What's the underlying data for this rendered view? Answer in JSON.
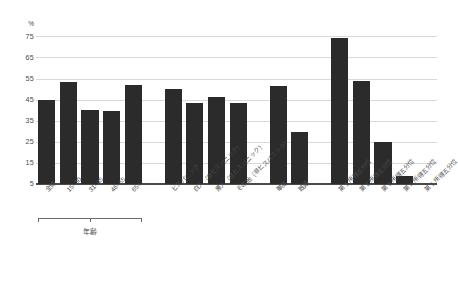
{
  "chart_data": {
    "type": "bar",
    "title": "",
    "subtitle": "",
    "xlabel": "",
    "ylabel": "%",
    "ylim": [
      5,
      78
    ],
    "yticks": [
      5,
      15,
      25,
      35,
      45,
      55,
      65,
      75
    ],
    "ytick_labels": [
      "5",
      "15",
      "25",
      "35",
      "45",
      "55",
      "65",
      "75"
    ],
    "unit_label": "%",
    "grid": true,
    "legend": "none",
    "bar_color": "#2b2b2b",
    "grid_color": "#d9d9d9",
    "axis_color": "#4a4a4a",
    "categories": [
      "全体",
      "15–30",
      "31–45",
      "46–65",
      "65+",
      "ヒスパニック",
      "白人（非ヒスパニック）",
      "黒人（非ヒスパニック）",
      "その他（非ヒスパニック）",
      "単身",
      "既婚",
      "第 1 所得五分位",
      "第 2 所得五分位",
      "第 3 所得五分位",
      "第 4 所得五分位",
      "第 5 所得五分位"
    ],
    "values": [
      45,
      53.5,
      40,
      39.5,
      52,
      50,
      43.5,
      46.5,
      43.5,
      51.5,
      29.5,
      74,
      54,
      25,
      9,
      0
    ],
    "groups": [
      {
        "label": "年齢",
        "bracket": true,
        "categories": [
          "全体",
          "15–30",
          "31–45",
          "46–65",
          "65+"
        ]
      },
      {
        "label": "",
        "bracket": false,
        "categories": [
          "ヒスパニック",
          "白人（非ヒスパニック）",
          "黒人（非ヒスパニック）",
          "その他（非ヒスパニック）"
        ]
      },
      {
        "label": "",
        "bracket": false,
        "categories": [
          "単身",
          "既婚"
        ]
      },
      {
        "label": "",
        "bracket": false,
        "categories": [
          "第 1 所得五分位",
          "第 2 所得五分位",
          "第 3 所得五分位",
          "第 4 所得五分位",
          "第 5 所得五分位"
        ]
      }
    ]
  },
  "axis": {
    "unit": "%",
    "ticks": [
      {
        "label": "75"
      },
      {
        "label": "65"
      },
      {
        "label": "55"
      },
      {
        "label": "45"
      },
      {
        "label": "35"
      },
      {
        "label": "25"
      },
      {
        "label": "15"
      },
      {
        "label": "5"
      }
    ]
  },
  "categories": [
    {
      "label": "全体"
    },
    {
      "label": "15–30"
    },
    {
      "label": "31–45"
    },
    {
      "label": "46–65"
    },
    {
      "label": "65+"
    },
    {
      "label": "ヒスパニック"
    },
    {
      "label": "白人（非ヒスパニック）"
    },
    {
      "label": "黒人（非ヒスパニック）"
    },
    {
      "label": "その他（非ヒスパニック）"
    },
    {
      "label": "単身"
    },
    {
      "label": "既婚"
    },
    {
      "label": "第 1 所得五分位"
    },
    {
      "label": "第 2 所得五分位"
    },
    {
      "label": "第 3 所得五分位"
    },
    {
      "label": "第 4 所得五分位"
    },
    {
      "label": "第 5 所得五分位"
    }
  ],
  "group_bracket": {
    "label": "年齢"
  }
}
